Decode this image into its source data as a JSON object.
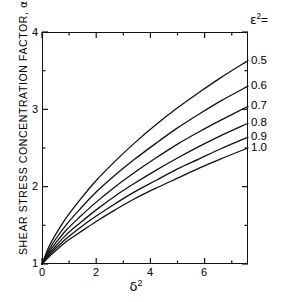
{
  "chart_data": {
    "type": "line",
    "title": "",
    "xlabel": "δ²",
    "ylabel": "SHEAR STRESS CONCENTRATION FACTOR, α",
    "xlim": [
      0,
      7.6
    ],
    "ylim": [
      1,
      4
    ],
    "xticks": [
      0,
      2,
      4,
      6
    ],
    "yticks": [
      1,
      2,
      3,
      4
    ],
    "xminor": [
      1,
      3,
      5,
      7
    ],
    "yminor": [
      1.5,
      2.5,
      3.5
    ],
    "grid": false,
    "legend_position": "right-of-axes",
    "legend_title": "ε² =",
    "series": [
      {
        "name": "0.5",
        "label": "0.5",
        "x": [
          0,
          0.25,
          0.5,
          0.9,
          1.4,
          2.0,
          2.7,
          3.4,
          4.2,
          5.0,
          5.8,
          6.6,
          7.6
        ],
        "y": [
          1.0,
          1.22,
          1.38,
          1.6,
          1.83,
          2.08,
          2.33,
          2.56,
          2.8,
          3.02,
          3.22,
          3.41,
          3.63
        ]
      },
      {
        "name": "0.6",
        "label": "0.6",
        "x": [
          0,
          0.25,
          0.5,
          0.9,
          1.4,
          2.0,
          2.7,
          3.4,
          4.2,
          5.0,
          5.8,
          6.6,
          7.6
        ],
        "y": [
          1.0,
          1.18,
          1.32,
          1.51,
          1.71,
          1.93,
          2.15,
          2.35,
          2.56,
          2.76,
          2.94,
          3.11,
          3.3
        ]
      },
      {
        "name": "0.7",
        "label": "0.7",
        "x": [
          0,
          0.25,
          0.5,
          0.9,
          1.4,
          2.0,
          2.7,
          3.4,
          4.2,
          5.0,
          5.8,
          6.6,
          7.6
        ],
        "y": [
          1.0,
          1.15,
          1.27,
          1.44,
          1.61,
          1.8,
          2.0,
          2.18,
          2.37,
          2.55,
          2.71,
          2.86,
          3.04
        ]
      },
      {
        "name": "0.8",
        "label": "0.8",
        "x": [
          0,
          0.25,
          0.5,
          0.9,
          1.4,
          2.0,
          2.7,
          3.4,
          4.2,
          5.0,
          5.8,
          6.6,
          7.6
        ],
        "y": [
          1.0,
          1.13,
          1.23,
          1.38,
          1.53,
          1.7,
          1.88,
          2.04,
          2.21,
          2.37,
          2.52,
          2.66,
          2.82
        ]
      },
      {
        "name": "0.9",
        "label": "0.9",
        "x": [
          0,
          0.25,
          0.5,
          0.9,
          1.4,
          2.0,
          2.7,
          3.4,
          4.2,
          5.0,
          5.8,
          6.6,
          7.6
        ],
        "y": [
          1.0,
          1.11,
          1.2,
          1.33,
          1.47,
          1.62,
          1.78,
          1.93,
          2.08,
          2.23,
          2.36,
          2.49,
          2.64
        ]
      },
      {
        "name": "1.0",
        "label": "1.0",
        "x": [
          0,
          0.25,
          0.5,
          0.9,
          1.4,
          2.0,
          2.7,
          3.4,
          4.2,
          5.0,
          5.8,
          6.6,
          7.6
        ],
        "y": [
          1.0,
          1.09,
          1.17,
          1.29,
          1.41,
          1.55,
          1.7,
          1.84,
          1.98,
          2.11,
          2.24,
          2.36,
          2.5
        ]
      }
    ]
  },
  "axes": {
    "y_title_text": "SHEAR STRESS CONCENTRATION FACTOR,",
    "y_title_symbol": "α",
    "x_title_symbol": "δ",
    "x_title_exponent": "2",
    "ytick_labels": [
      "4",
      "3",
      "2",
      "1"
    ],
    "xtick_labels": [
      "0",
      "2",
      "4",
      "6"
    ]
  },
  "legend": {
    "symbol": "ε",
    "exponent": "2",
    "equals": "=",
    "items": [
      "0.5",
      "0.6",
      "0.7",
      "0.8",
      "0.9",
      "1.0"
    ]
  },
  "colors": {
    "line": "#111111",
    "axis": "#111111",
    "background": "#ffffff"
  }
}
